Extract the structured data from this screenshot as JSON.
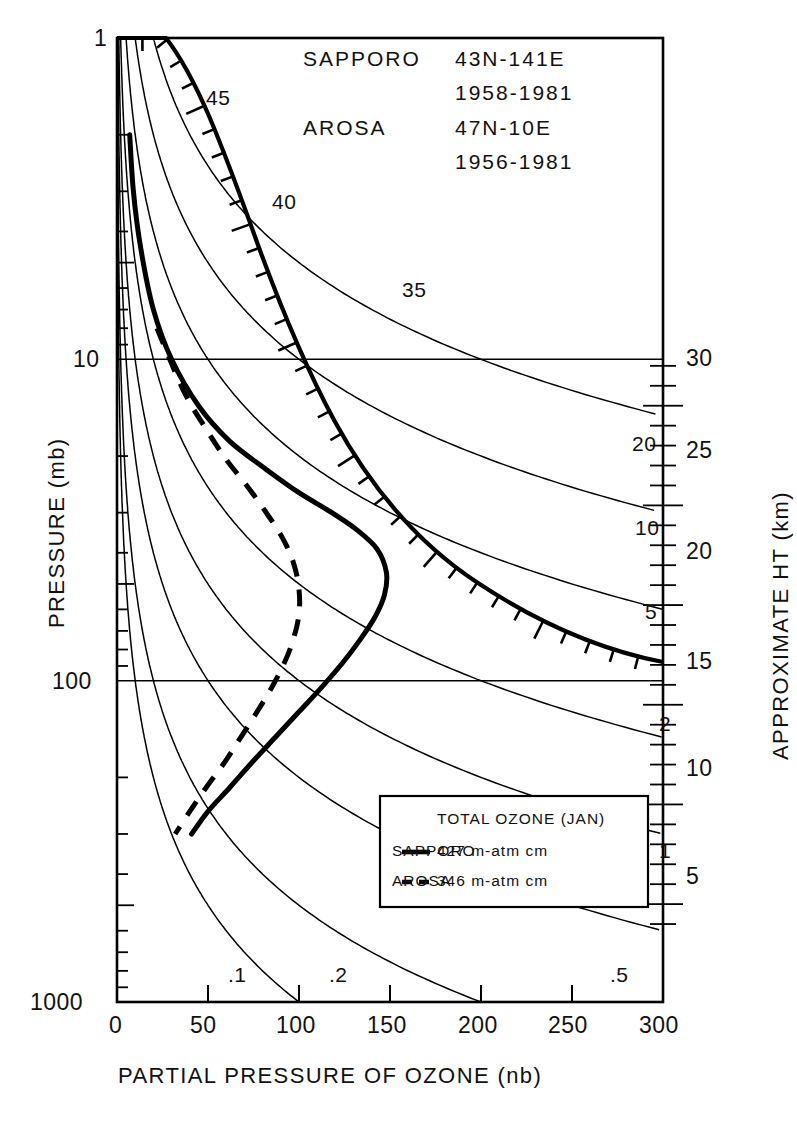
{
  "header": {
    "lines": [
      {
        "station": "SAPPORO",
        "coords": "43N-141E",
        "years": "1958-1981"
      },
      {
        "station": "AROSA",
        "coords": "47N-10E",
        "years": "1956-1981"
      }
    ],
    "l1_station": "SAPPORO",
    "l1_coords": "43N-141E",
    "l1_years": "1958-1981",
    "l2_station": "AROSA",
    "l2_coords": "47N-10E",
    "l2_years": "1956-1981"
  },
  "legend": {
    "title": "TOTAL OZONE (JAN)",
    "rows": [
      {
        "name": "SAPPORO",
        "dash": "solid",
        "value": "427 m-atm cm"
      },
      {
        "name": "AROSA",
        "dash": "dashed",
        "value": "346 m-atm cm"
      }
    ],
    "r1_name": "SAPPORO",
    "r1_value": "427 m-atm cm",
    "r2_name": "AROSA",
    "r2_value": "346 m-atm cm"
  },
  "axes": {
    "x_title": "PARTIAL PRESSURE OF OZONE (nb)",
    "y_title": "PRESSURE (mb)",
    "y2_title": "APPROXIMATE HT (km)",
    "x_ticks": [
      "0",
      "50",
      "100",
      "150",
      "200",
      "250",
      "300"
    ],
    "y_ticks": [
      "1",
      "10",
      "100",
      "1000"
    ],
    "y2_ticks": [
      "5",
      "10",
      "15",
      "20",
      "25",
      "30"
    ]
  },
  "contour_labels": {
    "alt_curve": [
      "45",
      "40",
      "35"
    ],
    "right": [
      "20",
      "10",
      "5",
      "2",
      "1"
    ],
    "bottom": [
      ".1",
      ".2",
      ".5"
    ]
  },
  "colors": {
    "ink": "#000000",
    "paper": "#ffffff"
  },
  "chart_data": {
    "type": "line",
    "title": "",
    "xlabel": "PARTIAL PRESSURE OF OZONE (nb)",
    "ylabel": "PRESSURE (mb)",
    "y2label": "APPROXIMATE HT (km)",
    "xlim": [
      0,
      300
    ],
    "ylim": [
      1000,
      1
    ],
    "yscale": "log",
    "grid": false,
    "legend_position": "lower-right-inside",
    "xticks": [
      0,
      50,
      100,
      150,
      200,
      250,
      300
    ],
    "yticks": [
      1,
      10,
      100,
      1000
    ],
    "y2ticks": [
      5,
      10,
      15,
      20,
      25,
      30
    ],
    "series": [
      {
        "name": "SAPPORO",
        "style": "solid",
        "total_ozone_m_atm_cm": 427,
        "points": [
          [
            7,
            2.0
          ],
          [
            9,
            3.0
          ],
          [
            13,
            4.5
          ],
          [
            20,
            7.0
          ],
          [
            30,
            10.0
          ],
          [
            45,
            14.0
          ],
          [
            62,
            18.0
          ],
          [
            82,
            22.0
          ],
          [
            100,
            26.0
          ],
          [
            118,
            30.0
          ],
          [
            132,
            34.0
          ],
          [
            143,
            39.0
          ],
          [
            148,
            46.0
          ],
          [
            147,
            54.0
          ],
          [
            142,
            63.0
          ],
          [
            134,
            74.0
          ],
          [
            124,
            88.0
          ],
          [
            113,
            104.0
          ],
          [
            100,
            125.0
          ],
          [
            87,
            150.0
          ],
          [
            74,
            180.0
          ],
          [
            62,
            215.0
          ],
          [
            50,
            255.0
          ],
          [
            41,
            300.0
          ]
        ]
      },
      {
        "name": "AROSA",
        "style": "dashed",
        "total_ozone_m_atm_cm": 346,
        "points": [
          [
            22,
            8.0
          ],
          [
            29,
            10.0
          ],
          [
            38,
            13.0
          ],
          [
            49,
            16.5
          ],
          [
            60,
            20.5
          ],
          [
            72,
            25.0
          ],
          [
            82,
            30.0
          ],
          [
            91,
            36.0
          ],
          [
            97,
            43.0
          ],
          [
            100,
            52.0
          ],
          [
            100,
            62.0
          ],
          [
            97,
            74.0
          ],
          [
            92,
            88.0
          ],
          [
            85,
            105.0
          ],
          [
            77,
            125.0
          ],
          [
            68,
            150.0
          ],
          [
            59,
            180.0
          ],
          [
            49,
            215.0
          ],
          [
            40,
            255.0
          ],
          [
            32,
            300.0
          ]
        ]
      }
    ],
    "mixing_ratio_contours": {
      "unit": "ppmv",
      "labels": [
        0.1,
        0.2,
        0.5,
        1,
        2,
        5,
        10,
        20
      ],
      "description": "Ozone volume mixing ratio isopleths (partial pressure = mixing ratio x total pressure)"
    },
    "altitude_curve": {
      "description": "Heavy curve with tick marks giving approximate height in km",
      "labels": [
        45,
        40,
        35,
        30
      ]
    },
    "annotations": [
      "SAPPORO 43N-141E 1958-1981",
      "AROSA 47N-10E 1956-1981",
      "TOTAL OZONE (JAN)",
      "SAPPORO - 427 m-atm cm",
      "AROSA -- 346 m-atm cm"
    ]
  }
}
